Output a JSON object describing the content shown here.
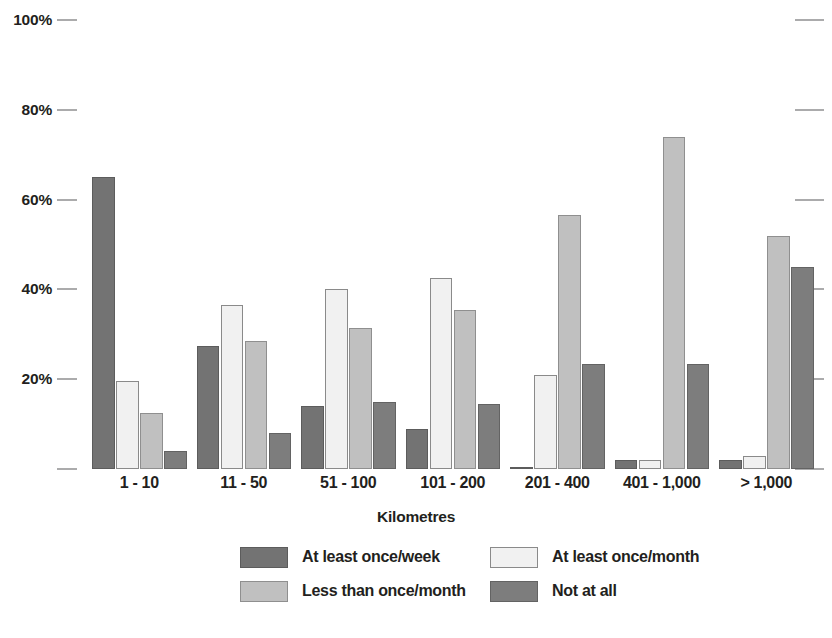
{
  "chart_data": {
    "type": "bar",
    "title": "",
    "subtitle": "",
    "xlabel": "Kilometres",
    "ylabel": "",
    "ylim": [
      0,
      100
    ],
    "grid": false,
    "legend_position": "bottom",
    "value_suffix": "%",
    "categories": [
      "1 - 10",
      "11 - 50",
      "51 - 100",
      "101 - 200",
      "201 - 400",
      "401 - 1,000",
      "> 1,000"
    ],
    "ytick_labels": [
      "100%",
      "80%",
      "60%",
      "40%",
      "20%",
      ""
    ],
    "ytick_values": [
      100,
      80,
      60,
      40,
      20,
      0
    ],
    "series": [
      {
        "name": "At least once/week",
        "color": "#737373",
        "values": [
          65,
          27.5,
          14,
          9,
          0.5,
          2,
          2
        ]
      },
      {
        "name": "At least once/month",
        "color": "#f1f1f1",
        "values": [
          19.5,
          36.5,
          40,
          42.5,
          21,
          2,
          3
        ]
      },
      {
        "name": "Less than once/month",
        "color": "#c0c0c0",
        "values": [
          12.5,
          28.5,
          31.5,
          35.5,
          56.5,
          74,
          52
        ]
      },
      {
        "name": "Not at all",
        "color": "#7d7d7d",
        "values": [
          4,
          8,
          15,
          14.5,
          23.5,
          23.5,
          45
        ]
      }
    ]
  },
  "colors": {
    "text": "#231f20",
    "axis": "#58595b",
    "background": "#ffffff"
  }
}
